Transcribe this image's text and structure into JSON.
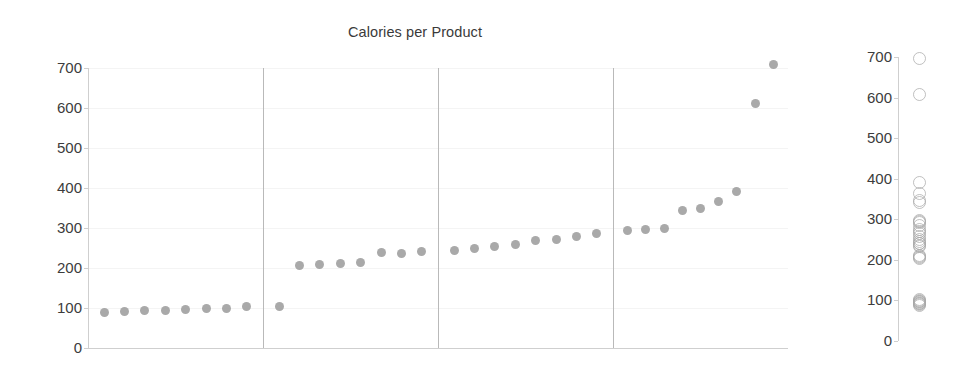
{
  "chart_data": {
    "type": "scatter",
    "title": "Calories per Product",
    "xlabel": "",
    "ylabel": "",
    "ylim": [
      0,
      700
    ],
    "yticks": [
      0,
      100,
      200,
      300,
      400,
      500,
      600,
      700
    ],
    "ytick_labels": [
      "0",
      "100",
      "200",
      "300",
      "400",
      "500",
      "600",
      "700"
    ],
    "grid": true,
    "grid_axis": "y",
    "legend": "none",
    "panels": [
      {
        "name": "panel-1",
        "values": [
          90,
          92,
          94,
          95,
          97,
          99,
          100,
          103
        ]
      },
      {
        "name": "panel-2",
        "values": [
          105,
          207,
          208,
          211,
          213,
          238,
          236,
          242
        ]
      },
      {
        "name": "panel-3",
        "values": [
          243,
          248,
          253,
          259,
          268,
          272,
          278,
          286
        ]
      },
      {
        "name": "panel-4",
        "values": [
          294,
          296,
          300,
          345,
          348,
          367,
          392,
          611,
          710
        ]
      }
    ],
    "all_values_sorted": [
      90,
      92,
      94,
      95,
      97,
      99,
      100,
      103,
      105,
      207,
      208,
      211,
      213,
      238,
      236,
      242,
      243,
      248,
      253,
      259,
      268,
      272,
      278,
      286,
      294,
      296,
      300,
      345,
      348,
      367,
      392,
      611,
      710
    ],
    "panel_divider_count": 3,
    "strip_plot": {
      "type": "scatter",
      "title": "",
      "ylim": [
        0,
        700
      ],
      "yticks": [
        0,
        100,
        200,
        300,
        400,
        500,
        600,
        700
      ],
      "ytick_labels": [
        "0",
        "100",
        "200",
        "300",
        "400",
        "500",
        "600",
        "700"
      ],
      "marker": "open-circle",
      "values": [
        90,
        92,
        94,
        95,
        97,
        99,
        100,
        103,
        105,
        207,
        208,
        211,
        213,
        236,
        238,
        242,
        243,
        248,
        253,
        259,
        268,
        272,
        278,
        286,
        294,
        296,
        300,
        345,
        348,
        367,
        392,
        611,
        700
      ]
    },
    "colors": {
      "marker_fill": "#9a9a9a",
      "marker_outline": "#a8a8a8",
      "gridline": "#f4f4f4",
      "axis": "#cfcfcf",
      "divider": "#b9b9b9",
      "text": "#3c3c3c",
      "background": "#ffffff"
    }
  }
}
